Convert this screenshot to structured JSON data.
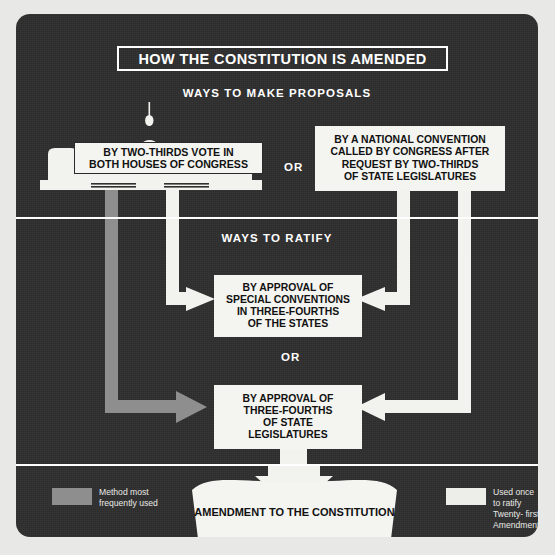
{
  "poster": {
    "title": "HOW THE CONSTITUTION IS AMENDED",
    "background_color": "#2f2f2f",
    "accent_white": "#f2f2ee",
    "accent_gray": "#8e8e8e"
  },
  "sections": {
    "proposals_heading": "WAYS TO MAKE PROPOSALS",
    "ratify_heading": "WAYS TO RATIFY",
    "or_top": "OR",
    "or_middle": "OR"
  },
  "boxes": {
    "congress": {
      "lines": [
        "BY TWO-THIRDS VOTE IN",
        "BOTH HOUSES OF CONGRESS"
      ],
      "line1": "BY TWO-THIRDS VOTE IN",
      "line2": "BOTH HOUSES OF CONGRESS"
    },
    "national_convention": {
      "line1": "BY A NATIONAL CONVENTION",
      "line2": "CALLED BY CONGRESS AFTER",
      "line3": "REQUEST BY TWO-THIRDS",
      "line4": "OF STATE LEGISLATURES"
    },
    "special_conventions": {
      "line1": "BY APPROVAL OF",
      "line2": "SPECIAL CONVENTIONS",
      "line3": "IN THREE-FOURTHS",
      "line4": "OF THE STATES"
    },
    "state_legislatures": {
      "line1": "BY APPROVAL OF",
      "line2": "THREE-FOURTHS",
      "line3": "OF STATE",
      "line4": "LEGISLATURES"
    },
    "amendment": {
      "line1": "AMENDMENT TO",
      "line2": "THE CONSTITUTION"
    }
  },
  "legend": {
    "most_frequent": {
      "swatch_color": "#8e8e8e",
      "text": "Method most\nfrequently used"
    },
    "used_once": {
      "swatch_color": "#ededea",
      "text": "Used once to ratify\nTwenty- first\nAmendment"
    }
  },
  "flow": {
    "proposal_sources": [
      "congress",
      "national_convention"
    ],
    "ratification_methods": [
      "special_conventions",
      "state_legislatures"
    ],
    "outcome": "amendment",
    "gray_path_note": "Congress proposal to state legislature ratification",
    "white_path_note": "All other paths"
  }
}
